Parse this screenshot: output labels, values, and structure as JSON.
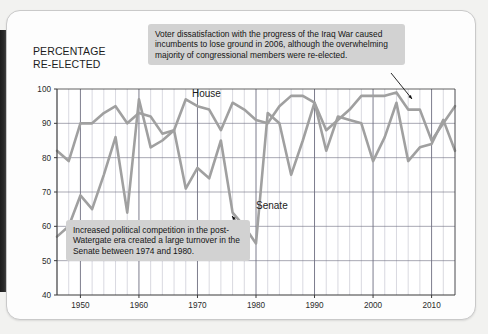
{
  "axis_title": "PERCENTAGE\nRE-ELECTED",
  "annotations": {
    "top": "Voter dissatisfaction with the progress of the Iraq War caused incumbents to lose ground in 2006, although the overwhelming majority of congressional members were re-elected.",
    "bottom": "Increased political competition in the post-Watergate era created a large turnover in the Senate between 1974 and 1980."
  },
  "series_labels": {
    "house": "House",
    "senate": "Senate"
  },
  "colors": {
    "line": "#a0a0a0",
    "grid_minor": "#b9b9c6",
    "grid_major": "#6e6e80",
    "axis": "#3a3a3a",
    "callout_bg": "#d2d2d2",
    "page": "#fdfdfd"
  },
  "chart_data": {
    "type": "line",
    "title": "",
    "xlabel": "",
    "ylabel": "PERCENTAGE RE-ELECTED",
    "xlim": [
      1946,
      2014
    ],
    "ylim": [
      40,
      100
    ],
    "yticks": [
      40,
      50,
      60,
      70,
      80,
      90,
      100
    ],
    "xticks": [
      1950,
      1960,
      1970,
      1980,
      1990,
      2000,
      2010
    ],
    "grid": true,
    "grid_minor_step": 2,
    "grid_major_step": 10,
    "legend": "inline-labels",
    "x": [
      1946,
      1948,
      1950,
      1952,
      1954,
      1956,
      1958,
      1960,
      1962,
      1964,
      1966,
      1968,
      1970,
      1972,
      1974,
      1976,
      1978,
      1980,
      1982,
      1984,
      1986,
      1988,
      1990,
      1992,
      1994,
      1996,
      1998,
      2000,
      2002,
      2004,
      2006,
      2008,
      2010,
      2012,
      2014
    ],
    "series": [
      {
        "name": "House",
        "values": [
          82,
          79,
          90,
          90,
          93,
          95,
          90,
          93,
          92,
          87,
          88,
          97,
          95,
          94,
          88,
          96,
          94,
          91,
          90,
          95,
          98,
          98,
          96,
          88,
          91,
          94,
          98,
          98,
          98,
          99,
          94,
          94,
          85,
          90,
          95
        ]
      },
      {
        "name": "Senate",
        "values": [
          57,
          60,
          69,
          65,
          75,
          86,
          64,
          97,
          83,
          85,
          88,
          71,
          77,
          74,
          85,
          64,
          60,
          55,
          93,
          90,
          75,
          85,
          96,
          82,
          92,
          91,
          90,
          79,
          86,
          96,
          79,
          83,
          84,
          91,
          82
        ]
      }
    ]
  }
}
